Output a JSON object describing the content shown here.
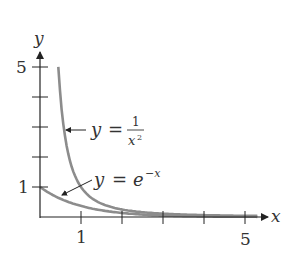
{
  "chart_data": {
    "type": "line",
    "title": "",
    "xlabel": "x",
    "ylabel": "y",
    "xlim": [
      0,
      5.6
    ],
    "ylim": [
      0,
      5.5
    ],
    "x_ticks": [
      1,
      2,
      3,
      4,
      5
    ],
    "x_tick_labels": [
      "1",
      "",
      "",
      "",
      "5"
    ],
    "y_ticks": [
      1,
      2,
      3,
      4,
      5
    ],
    "y_tick_labels": [
      "1",
      "",
      "",
      "",
      "5"
    ],
    "grid": false,
    "legend": "none (inline annotations with arrows)",
    "series": [
      {
        "name": "y = 1/x^2",
        "label_parts": {
          "lhs": "y",
          "eq": "=",
          "num": "1",
          "den": "x",
          "exp": "2"
        },
        "x": [
          0.45,
          0.5,
          0.6,
          0.7,
          0.8,
          1,
          1.25,
          1.5,
          2,
          2.5,
          3,
          4,
          5
        ],
        "y": [
          4.94,
          4.0,
          2.78,
          2.04,
          1.56,
          1.0,
          0.64,
          0.44,
          0.25,
          0.16,
          0.11,
          0.06,
          0.04
        ]
      },
      {
        "name": "y = e^-x",
        "label_parts": {
          "lhs": "y",
          "eq": "=",
          "base": "e",
          "exp": "−x"
        },
        "x": [
          0,
          0.5,
          1,
          1.5,
          2,
          2.5,
          3,
          4,
          5
        ],
        "y": [
          1.0,
          0.61,
          0.37,
          0.22,
          0.14,
          0.08,
          0.05,
          0.02,
          0.01
        ]
      }
    ],
    "colors": {
      "curve": "#8c8c8c",
      "axis": "#333333",
      "text": "#333333"
    }
  }
}
